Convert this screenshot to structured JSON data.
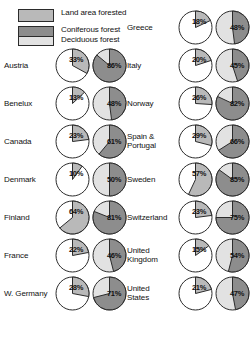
{
  "legend": {
    "items": [
      {
        "key": "land",
        "label": "Land area forested"
      },
      {
        "key": "coniferous",
        "label": "Coniferous forest"
      },
      {
        "key": "deciduous",
        "label": "Deciduous forest"
      }
    ]
  },
  "colors": {
    "land_area_forested": "#b9b9b9",
    "coniferous_forest": "#8d8d8d",
    "deciduous_forest": "#e2e2e2",
    "unforested": "#ffffff",
    "outline": "#2b2b2b"
  },
  "chart_data": {
    "type": "pie",
    "title": "",
    "xlabel": "",
    "ylabel": "",
    "units": "percent",
    "legend": [
      "Land area forested",
      "Coniferous forest",
      "Deciduous forest"
    ],
    "legend_position": "top-left",
    "grid": false,
    "series": [
      {
        "name": "Land area forested",
        "color": "#b9b9b9"
      },
      {
        "name": "Coniferous forest",
        "color": "#8d8d8d"
      },
      {
        "name": "Deciduous forest",
        "color": "#e2e2e2"
      }
    ],
    "categories": [
      "Austria",
      "Benelux",
      "Canada",
      "Denmark",
      "Finland",
      "France",
      "W. Germany",
      "Greece",
      "Italy",
      "Norway",
      "Spain & Portugal",
      "Sweden",
      "Switzerland",
      "United Kingdom",
      "United States"
    ],
    "land_area_forested": [
      33,
      13,
      23,
      10,
      64,
      22,
      28,
      18,
      20,
      26,
      29,
      57,
      23,
      15,
      21
    ],
    "coniferous_forest": [
      86,
      48,
      61,
      50,
      81,
      46,
      71,
      48,
      45,
      82,
      66,
      85,
      75,
      54,
      47
    ]
  },
  "columns": {
    "left": [
      {
        "label": "Austria",
        "forested": 33,
        "forested_text": "33%",
        "coniferous": 86,
        "coniferous_text": "86%"
      },
      {
        "label": "Benelux",
        "forested": 13,
        "forested_text": "13%",
        "coniferous": 48,
        "coniferous_text": "48%"
      },
      {
        "label": "Canada",
        "forested": 23,
        "forested_text": "23%",
        "coniferous": 61,
        "coniferous_text": "61%"
      },
      {
        "label": "Denmark",
        "forested": 10,
        "forested_text": "10%",
        "coniferous": 50,
        "coniferous_text": "50%"
      },
      {
        "label": "Finland",
        "forested": 64,
        "forested_text": "64%",
        "coniferous": 81,
        "coniferous_text": "81%"
      },
      {
        "label": "France",
        "forested": 22,
        "forested_text": "22%",
        "coniferous": 46,
        "coniferous_text": "46%"
      },
      {
        "label": "W. Germany",
        "forested": 28,
        "forested_text": "28%",
        "coniferous": 71,
        "coniferous_text": "71%"
      }
    ],
    "right": [
      {
        "label": "Greece",
        "forested": 18,
        "forested_text": "18%",
        "coniferous": 48,
        "coniferous_text": "48%"
      },
      {
        "label": "Italy",
        "forested": 20,
        "forested_text": "20%",
        "coniferous": 45,
        "coniferous_text": "45%"
      },
      {
        "label": "Norway",
        "forested": 26,
        "forested_text": "26%",
        "coniferous": 82,
        "coniferous_text": "82%"
      },
      {
        "label": "Spain &\nPortugal",
        "forested": 29,
        "forested_text": "29%",
        "coniferous": 66,
        "coniferous_text": "66%"
      },
      {
        "label": "Sweden",
        "forested": 57,
        "forested_text": "57%",
        "coniferous": 85,
        "coniferous_text": "85%"
      },
      {
        "label": "Switzerland",
        "forested": 23,
        "forested_text": "23%",
        "coniferous": 75,
        "coniferous_text": "75%"
      },
      {
        "label": "United\nKingdom",
        "forested": 15,
        "forested_text": "15%",
        "coniferous": 54,
        "coniferous_text": "54%"
      },
      {
        "label": "United\nStates",
        "forested": 21,
        "forested_text": "21%",
        "coniferous": 47,
        "coniferous_text": "47%"
      }
    ]
  }
}
